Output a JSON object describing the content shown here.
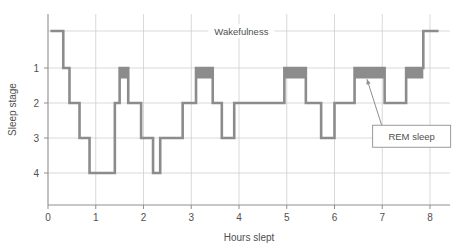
{
  "chart_data": {
    "type": "line",
    "title": "",
    "xlabel": "Hours slept",
    "ylabel": "Sleep stage",
    "xlim": [
      -0.15,
      8.4
    ],
    "ylim": [
      0,
      5.1
    ],
    "grid": true,
    "x_ticks": [
      0,
      1,
      2,
      3,
      4,
      5,
      6,
      7,
      8
    ],
    "x_tick_labels": [
      "0",
      "1",
      "2",
      "3",
      "4",
      "5",
      "6",
      "7",
      "8"
    ],
    "y_ticks": [
      1,
      2,
      3,
      4
    ],
    "y_tick_labels": [
      "1",
      "2",
      "3",
      "4"
    ],
    "wake_level": 0.2,
    "annotations": [
      {
        "name": "wakefulness-label",
        "text": "Wakefulness",
        "x": 4.05,
        "y": 0.2
      },
      {
        "name": "rem-sleep-label",
        "text": "REM sleep",
        "x": 7.05,
        "y": 2.95
      }
    ],
    "legend": [],
    "series": [
      {
        "name": "Sleep stage trace",
        "color": "#8c8c8c",
        "step": "post",
        "points": [
          {
            "x": 0.05,
            "y": 0.2
          },
          {
            "x": 0.32,
            "y": 0.2
          },
          {
            "x": 0.32,
            "y": 1.0
          },
          {
            "x": 0.45,
            "y": 1.0
          },
          {
            "x": 0.45,
            "y": 2.0
          },
          {
            "x": 0.66,
            "y": 2.0
          },
          {
            "x": 0.66,
            "y": 3.0
          },
          {
            "x": 0.87,
            "y": 3.0
          },
          {
            "x": 0.87,
            "y": 4.0
          },
          {
            "x": 1.4,
            "y": 4.0
          },
          {
            "x": 1.4,
            "y": 2.0
          },
          {
            "x": 1.5,
            "y": 2.0
          },
          {
            "x": 1.5,
            "y": 1.0
          },
          {
            "x": 1.68,
            "y": 1.0
          },
          {
            "x": 1.68,
            "y": 2.0
          },
          {
            "x": 1.95,
            "y": 2.0
          },
          {
            "x": 1.95,
            "y": 3.0
          },
          {
            "x": 2.2,
            "y": 3.0
          },
          {
            "x": 2.2,
            "y": 4.0
          },
          {
            "x": 2.35,
            "y": 4.0
          },
          {
            "x": 2.35,
            "y": 3.0
          },
          {
            "x": 2.82,
            "y": 3.0
          },
          {
            "x": 2.82,
            "y": 2.0
          },
          {
            "x": 3.1,
            "y": 2.0
          },
          {
            "x": 3.1,
            "y": 1.0
          },
          {
            "x": 3.45,
            "y": 1.0
          },
          {
            "x": 3.45,
            "y": 2.0
          },
          {
            "x": 3.64,
            "y": 2.0
          },
          {
            "x": 3.64,
            "y": 3.0
          },
          {
            "x": 3.9,
            "y": 3.0
          },
          {
            "x": 3.9,
            "y": 2.0
          },
          {
            "x": 4.95,
            "y": 2.0
          },
          {
            "x": 4.95,
            "y": 1.0
          },
          {
            "x": 5.4,
            "y": 1.0
          },
          {
            "x": 5.4,
            "y": 2.0
          },
          {
            "x": 5.72,
            "y": 2.0
          },
          {
            "x": 5.72,
            "y": 3.0
          },
          {
            "x": 6.0,
            "y": 3.0
          },
          {
            "x": 6.0,
            "y": 2.0
          },
          {
            "x": 6.42,
            "y": 2.0
          },
          {
            "x": 6.42,
            "y": 1.0
          },
          {
            "x": 7.05,
            "y": 1.0
          },
          {
            "x": 7.05,
            "y": 2.0
          },
          {
            "x": 7.5,
            "y": 2.0
          },
          {
            "x": 7.5,
            "y": 1.0
          },
          {
            "x": 7.86,
            "y": 1.0
          },
          {
            "x": 7.86,
            "y": 0.2
          },
          {
            "x": 8.18,
            "y": 0.2
          }
        ]
      }
    ],
    "rem_blocks": [
      {
        "name": "rem-block-1",
        "x_start": 1.5,
        "x_end": 1.68,
        "y_top": 1.0,
        "y_bottom": 1.3
      },
      {
        "name": "rem-block-2",
        "x_start": 3.1,
        "x_end": 3.45,
        "y_top": 1.0,
        "y_bottom": 1.3
      },
      {
        "name": "rem-block-3",
        "x_start": 4.95,
        "x_end": 5.4,
        "y_top": 1.0,
        "y_bottom": 1.3
      },
      {
        "name": "rem-block-4",
        "x_start": 6.42,
        "x_end": 7.05,
        "y_top": 1.0,
        "y_bottom": 1.3
      },
      {
        "name": "rem-block-5",
        "x_start": 7.5,
        "x_end": 7.86,
        "y_top": 1.0,
        "y_bottom": 1.3
      }
    ],
    "rem_fill_color": "#8c8c8c",
    "line_color": "#8c8c8c",
    "grid_color": "#cfcfcf",
    "axis_color": "#8f8f8f",
    "text_color": "#4f4f4f",
    "background_color": "#ffffff",
    "callout": {
      "arrow_from_x": 7.05,
      "arrow_from_y": 2.9,
      "arrow_to_x": 6.68,
      "arrow_to_y": 1.32
    }
  }
}
